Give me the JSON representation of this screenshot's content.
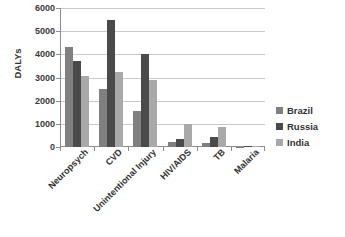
{
  "chart_data": {
    "type": "bar",
    "title": "",
    "xlabel": "",
    "ylabel": "DALYs",
    "ylim": [
      0,
      6000
    ],
    "ytick_step": 1000,
    "yticks": [
      "0",
      "1000",
      "2000",
      "3000",
      "4000",
      "5000",
      "6000"
    ],
    "grid": true,
    "legend_position": "right",
    "categories": [
      "Neuropsych",
      "CVD",
      "Unintentional Injury",
      "HIV/AIDS",
      "TB",
      "Malaria"
    ],
    "series": [
      {
        "name": "Brazil",
        "color": "#808080",
        "values": [
          4300,
          2500,
          1550,
          220,
          170,
          20
        ]
      },
      {
        "name": "Russia",
        "color": "#4a4a4a",
        "values": [
          3700,
          5500,
          4000,
          350,
          430,
          25
        ]
      },
      {
        "name": "India",
        "color": "#a9a9a9",
        "values": [
          3050,
          3250,
          2900,
          1000,
          850,
          60
        ]
      }
    ]
  },
  "axis": {
    "y_title": "DALYs"
  },
  "legend": {
    "items": [
      {
        "label": "Brazil",
        "color": "#808080"
      },
      {
        "label": "Russia",
        "color": "#4a4a4a"
      },
      {
        "label": "India",
        "color": "#a9a9a9"
      }
    ]
  }
}
